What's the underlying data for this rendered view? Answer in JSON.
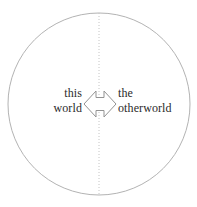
{
  "diagram": {
    "type": "venn-style circle split by dotted vertical diameter with bidirectional arrow",
    "circle": {
      "name": "outer-circle",
      "center_x": 99,
      "center_y": 104,
      "radius": 91,
      "stroke_color": "#b3b3b3",
      "stroke_width": 1,
      "fill": "none"
    },
    "divider": {
      "name": "vertical-dotted-divider",
      "x": 99,
      "y_top": 13,
      "y_bottom": 195,
      "stroke_color": "#c4c4c4",
      "dash": "1 2"
    },
    "arrow": {
      "name": "bidirectional-arrow",
      "label": "double-headed horizontal arrow",
      "stroke_color": "#8f8f8f",
      "fill": "#ffffff",
      "left_tip_x": 84,
      "right_tip_x": 116,
      "center_y": 104
    },
    "left_label": {
      "line1": "this",
      "line2": "world"
    },
    "right_label": {
      "line1": "the",
      "line2": "otherworld"
    },
    "text_color": "#2b2b2b",
    "background_color": "#ffffff"
  }
}
